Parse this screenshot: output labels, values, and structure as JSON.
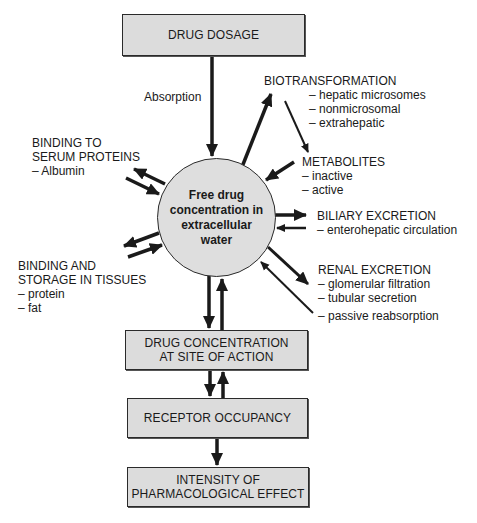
{
  "diagram": {
    "boxes": {
      "drug_dosage": "DRUG DOSAGE",
      "site_of_action_line1": "DRUG CONCENTRATION",
      "site_of_action_line2": "AT SITE OF ACTION",
      "receptor_occupancy": "RECEPTOR OCCUPANCY",
      "effect_line1": "INTENSITY OF",
      "effect_line2": "PHARMACOLOGICAL EFFECT"
    },
    "center": {
      "line1": "Free drug",
      "line2": "concentration in",
      "line3": "extracellular",
      "line4": "water"
    },
    "absorption_label": "Absorption",
    "biotransformation": {
      "title": "BIOTRANSFORMATION",
      "items": [
        "– hepatic microsomes",
        "– nonmicrosomal",
        "– extrahepatic"
      ]
    },
    "metabolites": {
      "title": "METABOLITES",
      "items": [
        "– inactive",
        "– active"
      ]
    },
    "biliary_excretion": {
      "title": "BILIARY EXCRETION",
      "items": [
        "– enterohepatic circulation"
      ]
    },
    "renal_excretion": {
      "title": "RENAL EXCRETION",
      "items": [
        "– glomerular filtration",
        "– tubular secretion"
      ],
      "reabsorption": "– passive reabsorption"
    },
    "serum_binding": {
      "title_line1": "BINDING TO",
      "title_line2": "SERUM PROTEINS",
      "items": [
        "– Albumin"
      ]
    },
    "tissue_binding": {
      "title_line1": "BINDING AND",
      "title_line2": "STORAGE IN TISSUES",
      "items": [
        "– protein",
        "– fat"
      ]
    },
    "colors": {
      "box_fill": "#dcdcdc",
      "circle_fill": "#dedede",
      "stroke": "#1a1a1a"
    }
  }
}
